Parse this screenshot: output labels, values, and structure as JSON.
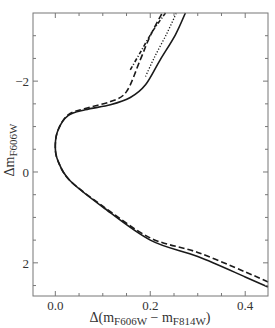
{
  "chart_data": {
    "type": "line",
    "title": "",
    "xlabel": "Δ(m_F606W − m_F814W)",
    "ylabel": "Δm_F606W",
    "xlabel_parts": {
      "prefix": "Δ(m",
      "sub1": "F606W",
      "mid": " − m",
      "sub2": "F814W",
      "suffix": ")"
    },
    "ylabel_parts": {
      "prefix": "Δm",
      "sub": "F606W"
    },
    "xlim": [
      -0.047,
      0.448
    ],
    "ylim": [
      2.73,
      -3.5
    ],
    "y_inverted": true,
    "x_ticks": [
      {
        "value": 0.0,
        "label": "0.0"
      },
      {
        "value": 0.2,
        "label": "0.2"
      },
      {
        "value": 0.4,
        "label": "0.4"
      }
    ],
    "x_minor_ticks": [
      0.05,
      0.1,
      0.15,
      0.25,
      0.3,
      0.35
    ],
    "y_ticks": [
      {
        "value": -2,
        "label": "−2"
      },
      {
        "value": 0,
        "label": "0"
      },
      {
        "value": 2,
        "label": "2"
      }
    ],
    "y_minor_ticks": [
      -3,
      -2.5,
      -1.5,
      -1,
      -0.5,
      0.5,
      1,
      1.5,
      2.5
    ],
    "grid": false,
    "legend": null,
    "series": [
      {
        "name": "solid",
        "style": "solid",
        "x": [
          0.448,
          0.4,
          0.3,
          0.2,
          0.1,
          0.03,
          0.005,
          0.0,
          0.006,
          0.027,
          0.063,
          0.116,
          0.158,
          0.19,
          0.221,
          0.253,
          0.274
        ],
        "y": [
          2.53,
          2.31,
          1.86,
          1.5,
          0.77,
          0.18,
          -0.26,
          -0.59,
          -0.93,
          -1.24,
          -1.37,
          -1.48,
          -1.64,
          -1.92,
          -2.47,
          -3.02,
          -3.5
        ]
      },
      {
        "name": "dashed",
        "style": "dashed",
        "x": [
          0.448,
          0.4,
          0.3,
          0.2,
          0.1,
          0.03,
          0.005,
          0.0,
          0.006,
          0.027,
          0.063,
          0.116,
          0.15,
          0.179,
          0.2,
          0.225
        ],
        "y": [
          2.42,
          2.2,
          1.77,
          1.45,
          0.75,
          0.18,
          -0.26,
          -0.59,
          -0.93,
          -1.26,
          -1.4,
          -1.55,
          -1.77,
          -2.47,
          -3.0,
          -3.5
        ]
      },
      {
        "name": "dash-dot",
        "style": "dashdot",
        "x": [
          0.158,
          0.18,
          0.205,
          0.232
        ],
        "y": [
          -2.25,
          -2.65,
          -3.1,
          -3.5
        ]
      },
      {
        "name": "dotted",
        "style": "dotted",
        "x": [
          0.19,
          0.21,
          0.235,
          0.255
        ],
        "y": [
          -2.1,
          -2.55,
          -3.05,
          -3.5
        ]
      }
    ]
  }
}
